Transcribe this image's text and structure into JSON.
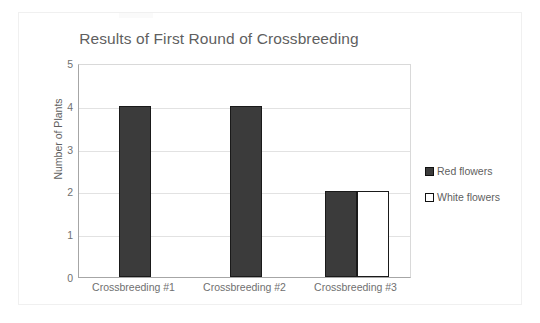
{
  "chart_data": {
    "type": "bar",
    "title": "Results of First Round of Crossbreeding",
    "xlabel": "",
    "ylabel": "Number of Plants",
    "categories": [
      "Crossbreeding #1",
      "Crossbreeding #2",
      "Crossbreeding #3"
    ],
    "series": [
      {
        "name": "Red flowers",
        "values": [
          4,
          4,
          2
        ],
        "color": "#3b3b3b"
      },
      {
        "name": "White flowers",
        "values": [
          0,
          0,
          2
        ],
        "color": "#ffffff"
      }
    ],
    "ylim": [
      0,
      5
    ],
    "yticks": [
      0,
      1,
      2,
      3,
      4,
      5
    ],
    "ytick_labels": [
      "0",
      "1",
      "2",
      "3",
      "4",
      "5"
    ],
    "grid": true,
    "legend_position": "right",
    "title_color": "#5f5f5f",
    "axis_text_color": "#707070",
    "gridline_color": "#e2e2e2",
    "bar_border_color": "#1a1a1a"
  },
  "legend": {
    "items": [
      {
        "label": "Red flowers",
        "swatch": "red"
      },
      {
        "label": "White flowers",
        "swatch": "white"
      }
    ]
  }
}
